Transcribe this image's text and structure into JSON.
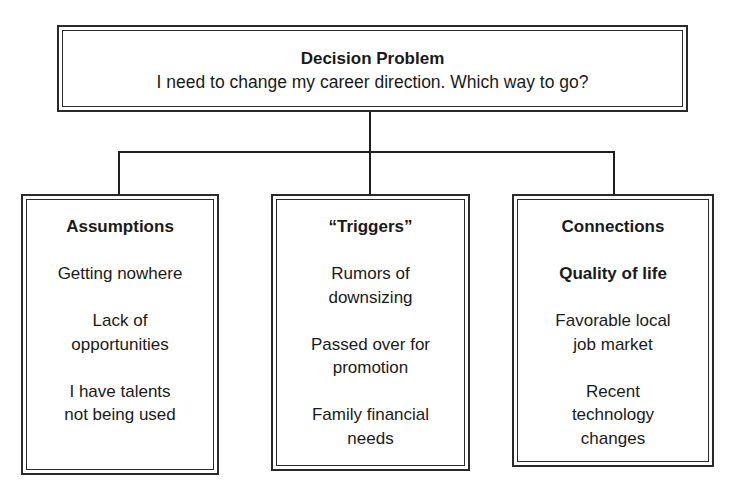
{
  "diagram": {
    "problem": {
      "title": "Decision Problem",
      "text": "I need to change my career direction. Which way to go?"
    },
    "columns": [
      {
        "heading": "Assumptions",
        "items": [
          {
            "text": "Getting nowhere",
            "bold": false
          },
          {
            "text": "Lack of\nopportunities",
            "bold": false
          },
          {
            "text": "I have talents\nnot being used",
            "bold": false
          }
        ]
      },
      {
        "heading": "“Triggers”",
        "items": [
          {
            "text": "Rumors of\ndownsizing",
            "bold": false
          },
          {
            "text": "Passed over for\npromotion",
            "bold": false
          },
          {
            "text": "Family financial\nneeds",
            "bold": false
          }
        ]
      },
      {
        "heading": "Connections",
        "items": [
          {
            "text": "Quality of life",
            "bold": true
          },
          {
            "text": "Favorable local\njob market",
            "bold": false
          },
          {
            "text": "Recent\ntechnology\nchanges",
            "bold": false
          }
        ]
      }
    ],
    "colors": {
      "line": "#1f1f1f",
      "background": "#ffffff",
      "text": "#1a1a1a"
    }
  }
}
